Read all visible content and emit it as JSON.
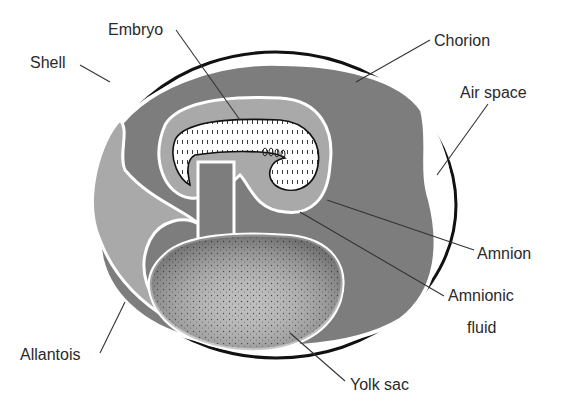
{
  "diagram": {
    "colors": {
      "background": "#ffffff",
      "shell_outline": "#111111",
      "dark_fill": "#7d7d7d",
      "medium_fill": "#a9a9a9",
      "light_fill": "#c4c4c4",
      "membrane": "#ffffff",
      "yolk_fill": "#bdbdbd",
      "yolk_dots": "#3a3a3a",
      "embryo_fill": "#ffffff",
      "label_text": "#2a2a2a"
    },
    "labels": {
      "embryo": "Embryo",
      "shell": "Shell",
      "chorion": "Chorion",
      "air_space": "Air space",
      "amnion": "Amnion",
      "amnionic_fluid_line1": "Amnionic",
      "amnionic_fluid_line2": "fluid",
      "allantois": "Allantois",
      "yolk_sac": "Yolk sac"
    }
  }
}
